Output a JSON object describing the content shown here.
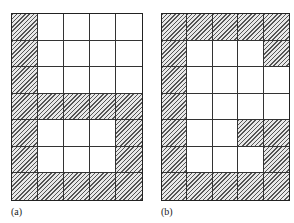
{
  "figures": [
    {
      "id": "a",
      "label": "(a)",
      "cols": 5,
      "rows": 7,
      "shaded": [
        [
          1,
          0,
          0,
          0,
          0
        ],
        [
          1,
          0,
          0,
          0,
          0
        ],
        [
          1,
          0,
          0,
          0,
          0
        ],
        [
          1,
          1,
          1,
          1,
          1
        ],
        [
          1,
          0,
          0,
          0,
          1
        ],
        [
          1,
          0,
          0,
          0,
          1
        ],
        [
          1,
          1,
          1,
          1,
          1
        ]
      ]
    },
    {
      "id": "b",
      "label": "(b)",
      "cols": 5,
      "rows": 7,
      "shaded": [
        [
          1,
          1,
          1,
          1,
          1
        ],
        [
          1,
          0,
          0,
          0,
          1
        ],
        [
          1,
          0,
          0,
          0,
          0
        ],
        [
          1,
          0,
          0,
          0,
          0
        ],
        [
          1,
          0,
          0,
          1,
          1
        ],
        [
          1,
          0,
          0,
          0,
          1
        ],
        [
          1,
          1,
          1,
          1,
          1
        ]
      ]
    }
  ]
}
